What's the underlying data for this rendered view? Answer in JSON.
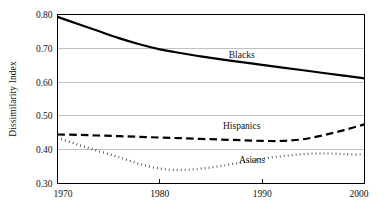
{
  "chart_data": {
    "type": "line",
    "title": "",
    "subtitle": "",
    "xlabel": "",
    "ylabel": "Dissimilarity Index",
    "xlim": [
      1970,
      2000
    ],
    "ylim": [
      0.3,
      0.8
    ],
    "grid": true,
    "legend_position": "inline-labels",
    "x_ticks": [
      "1970",
      "1980",
      "1990",
      "2000"
    ],
    "x_tick_values": [
      1970,
      1980,
      1990,
      2000
    ],
    "y_ticks": [
      "0.30",
      "0.40",
      "0.50",
      "0.60",
      "0.70",
      "0.80"
    ],
    "y_tick_values": [
      0.3,
      0.4,
      0.5,
      0.6,
      0.7,
      0.8
    ],
    "x": [
      1970,
      1972,
      1974,
      1976,
      1978,
      1980,
      1982,
      1984,
      1986,
      1988,
      1990,
      1992,
      1994,
      1996,
      1998,
      2000
    ],
    "series": [
      {
        "name": "Blacks",
        "style": "solid",
        "color": "#000000",
        "label_x": 1988,
        "label_y": 0.672,
        "values": [
          0.793,
          0.772,
          0.751,
          0.73,
          0.712,
          0.697,
          0.686,
          0.676,
          0.667,
          0.659,
          0.651,
          0.643,
          0.635,
          0.627,
          0.619,
          0.611
        ]
      },
      {
        "name": "Hispanics",
        "style": "dashed",
        "color": "#000000",
        "label_x": 1988,
        "label_y": 0.462,
        "values": [
          0.445,
          0.444,
          0.442,
          0.44,
          0.438,
          0.436,
          0.434,
          0.432,
          0.43,
          0.428,
          0.426,
          0.426,
          0.431,
          0.443,
          0.458,
          0.475
        ]
      },
      {
        "name": "Asians",
        "style": "dotted",
        "color": "#000000",
        "label_x": 1989,
        "label_y": 0.362,
        "values": [
          0.435,
          0.415,
          0.396,
          0.378,
          0.358,
          0.344,
          0.34,
          0.344,
          0.352,
          0.362,
          0.373,
          0.381,
          0.387,
          0.389,
          0.387,
          0.385
        ]
      }
    ]
  }
}
